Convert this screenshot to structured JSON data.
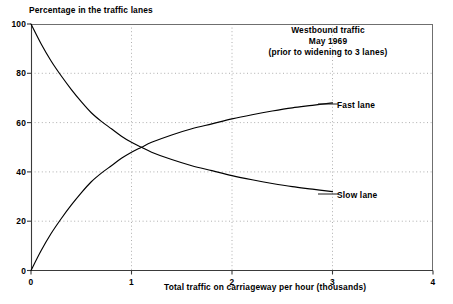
{
  "chart_data": {
    "type": "line",
    "title": "",
    "ylabel": "Percentage in the traffic lanes",
    "xlabel": "Total traffic on carriageway per hour (thousands)",
    "xlim": [
      0,
      4
    ],
    "ylim": [
      0,
      100
    ],
    "grid": true,
    "xticks": [
      "0",
      "1",
      "2",
      "3",
      "4"
    ],
    "yticks": [
      "0",
      "20",
      "40",
      "60",
      "80",
      "100"
    ],
    "legend_position": "inline-right-of-curve-ends",
    "annotations": [
      "Westbound traffic",
      "May 1969",
      "(prior to widening to 3 lanes)"
    ],
    "series": [
      {
        "name": "Slow lane",
        "label": "Slow lane",
        "color": "#000000",
        "x": [
          0.0,
          0.1,
          0.2,
          0.3,
          0.4,
          0.5,
          0.6,
          0.7,
          0.8,
          0.9,
          1.0,
          1.1,
          1.2,
          1.4,
          1.6,
          1.8,
          2.0,
          2.2,
          2.4,
          2.6,
          2.8,
          3.0
        ],
        "values": [
          100,
          92,
          85,
          79,
          73.5,
          68.5,
          64,
          60.5,
          57.5,
          54.5,
          52,
          50,
          48,
          45,
          42.5,
          40.5,
          38.5,
          36.8,
          35.3,
          34.0,
          33.0,
          32.0
        ]
      },
      {
        "name": "Fast lane",
        "label": "Fast lane",
        "color": "#000000",
        "x": [
          0.0,
          0.1,
          0.2,
          0.3,
          0.4,
          0.5,
          0.6,
          0.7,
          0.8,
          0.9,
          1.0,
          1.1,
          1.2,
          1.4,
          1.6,
          1.8,
          2.0,
          2.2,
          2.4,
          2.6,
          2.8,
          3.0
        ],
        "values": [
          0,
          8,
          15,
          21,
          26.5,
          31.5,
          36,
          39.5,
          42.5,
          45.5,
          48,
          50,
          52,
          55,
          57.5,
          59.5,
          61.5,
          63.2,
          64.7,
          66.0,
          67.0,
          68.0
        ]
      }
    ]
  },
  "colors": {
    "axis": "#2b2b2b",
    "grid": "#9a9a9a",
    "curve": "#1a1a1a",
    "text": "#000000",
    "background": "#ffffff"
  }
}
